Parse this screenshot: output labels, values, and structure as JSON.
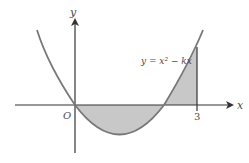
{
  "diagram": {
    "type": "function-graph",
    "function_label": "y = x² − kx",
    "axes": {
      "x_label": "x",
      "y_label": "y",
      "origin_label": "O"
    },
    "tick_labels": [
      {
        "value": 3,
        "label": "3"
      }
    ],
    "shaded_regions": [
      "region between curve and x-axis from x = 0 to x = k (below axis)",
      "region between curve and x-axis from x = k to x = 3 (above axis)"
    ],
    "colors": {
      "curve": "#777777",
      "axes": "#333333",
      "shade": "#c8c8c8"
    }
  }
}
